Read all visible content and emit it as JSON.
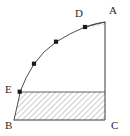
{
  "figure": {
    "kind": "geometry-diagram",
    "background_color": "#ffffff",
    "stroke_color": "#3a3a3a",
    "hatch_color": "#8a8a8a",
    "marker_color": "#1a1a1a",
    "canvas": {
      "width": 130,
      "height": 136
    },
    "vertices": [
      {
        "id": "A",
        "label": "A",
        "x": 105,
        "y": 22,
        "label_x": 109,
        "label_y": 8
      },
      {
        "id": "B",
        "label": "B",
        "x": 14,
        "y": 120,
        "label_x": 6,
        "label_y": 121
      },
      {
        "id": "C",
        "label": "C",
        "x": 105,
        "y": 120,
        "label_x": 111,
        "label_y": 121
      },
      {
        "id": "D",
        "label": "D",
        "x": 85,
        "y": 27,
        "label_x": 76,
        "label_y": 12
      },
      {
        "id": "E",
        "label": "E",
        "x": 20,
        "y": 92,
        "label_x": 6,
        "label_y": 86
      }
    ],
    "curve_markers": [
      {
        "x": 20,
        "y": 92
      },
      {
        "x": 34,
        "y": 64
      },
      {
        "x": 56,
        "y": 42
      },
      {
        "x": 85,
        "y": 27
      }
    ],
    "edges": [
      {
        "name": "right-edge-A-to-C",
        "from": "A",
        "to": "C"
      },
      {
        "name": "bottom-edge-B-to-C",
        "from": "B",
        "to": "C"
      },
      {
        "name": "top-edge-D-to-A",
        "from": "D",
        "to": "A"
      },
      {
        "name": "chord-E-to-right",
        "from": "E",
        "to": "C-column"
      }
    ],
    "hatched_regions": [
      {
        "name": "upper-sliver-D-A",
        "between": [
          "D",
          "A"
        ]
      },
      {
        "name": "lower-region-E-B-C",
        "between": [
          "E",
          "B",
          "C"
        ]
      }
    ]
  }
}
